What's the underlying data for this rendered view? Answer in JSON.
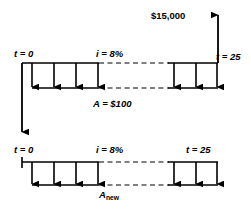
{
  "diagram": {
    "background_color": "#ffffff",
    "line_color": "#000000",
    "labels": {
      "future_amount": "$15,000",
      "t_start_top": "t = 0",
      "rate_top": "i = 8%",
      "t_end_top": "t = 25",
      "annuity_top": "A = $100",
      "t_start_bottom": "t = 0",
      "rate_bottom": "i = 8%",
      "t_end_bottom": "t = 25",
      "annuity_bottom_base": "A",
      "annuity_bottom_sub": "new"
    },
    "top_timeline": {
      "axis_y": 63,
      "baseline_y": 88,
      "x_start": 22,
      "x_end": 218,
      "solid_left_end": 99,
      "solid_right_start": 168,
      "arrow_count_left": 4,
      "arrow_count_right": 3,
      "arrow_direction": "down"
    },
    "bottom_timeline": {
      "axis_y": 162,
      "baseline_y": 185,
      "x_start": 22,
      "x_end": 218,
      "solid_left_end": 99,
      "solid_right_start": 168,
      "arrow_count_left": 4,
      "arrow_count_right": 3,
      "arrow_direction": "down"
    },
    "future_arrow": {
      "x": 218,
      "y_top": 14,
      "y_bottom": 63,
      "direction": "up"
    },
    "equivalence_arrow": {
      "x": 22,
      "y_top": 63,
      "y_bottom": 133,
      "direction": "down"
    }
  }
}
